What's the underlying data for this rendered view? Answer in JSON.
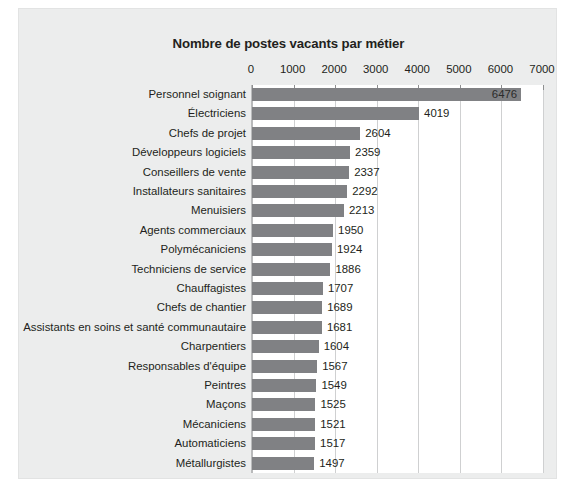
{
  "chart_data": {
    "type": "bar",
    "orientation": "horizontal",
    "title": "Nombre de postes vacants par métier",
    "xlabel": "",
    "ylabel": "",
    "xlim": [
      0,
      7000
    ],
    "xticks": [
      0,
      1000,
      2000,
      3000,
      4000,
      5000,
      6000,
      7000
    ],
    "xtick_labels": [
      "0",
      "1000",
      "2000",
      "3000",
      "4000",
      "5000",
      "6000",
      "7000"
    ],
    "grid": "vertical",
    "legend": "none",
    "bar_color": "#808184",
    "plot_background": "#ffffff",
    "figure_background": "#eceded",
    "categories": [
      "Personnel soignant",
      "Électriciens",
      "Chefs de projet",
      "Développeurs logiciels",
      "Conseillers de vente",
      "Installateurs sanitaires",
      "Menuisiers",
      "Agents commerciaux",
      "Polymécaniciens",
      "Techniciens de service",
      "Chauffagistes",
      "Chefs de chantier",
      "Assistants en soins et santé communautaire",
      "Charpentiers",
      "Responsables d'équipe",
      "Peintres",
      "Maçons",
      "Mécaniciens",
      "Automaticiens",
      "Métallurgistes"
    ],
    "values": [
      6476,
      4019,
      2604,
      2359,
      2337,
      2292,
      2213,
      1950,
      1924,
      1886,
      1707,
      1689,
      1681,
      1604,
      1567,
      1549,
      1525,
      1521,
      1517,
      1497
    ],
    "value_labels": [
      "6476",
      "4019",
      "2604",
      "2359",
      "2337",
      "2292",
      "2213",
      "1950",
      "1924",
      "1886",
      "1707",
      "1689",
      "1681",
      "1604",
      "1567",
      "1549",
      "1525",
      "1521",
      "1517",
      "1497"
    ],
    "label_position": [
      "inside",
      "outside",
      "outside",
      "outside",
      "outside",
      "outside",
      "outside",
      "outside",
      "outside",
      "outside",
      "outside",
      "outside",
      "outside",
      "outside",
      "outside",
      "outside",
      "outside",
      "outside",
      "outside",
      "outside"
    ]
  }
}
